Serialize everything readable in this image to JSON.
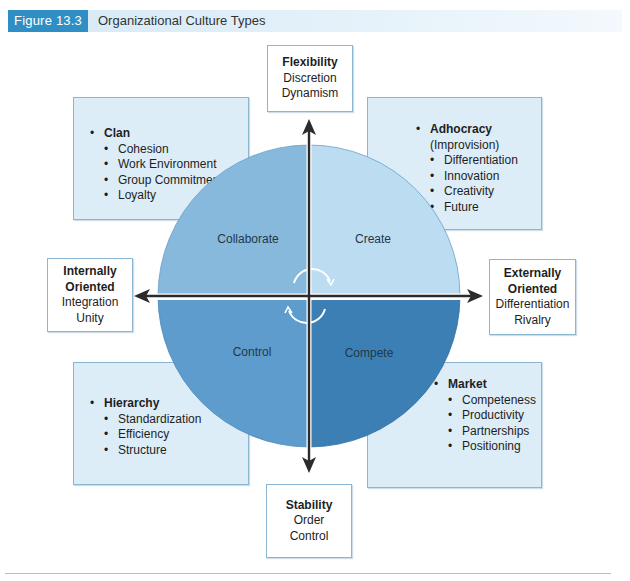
{
  "figure": {
    "label": "Figure 13.3",
    "title": "Organizational Culture Types",
    "colors": {
      "label_bg": "#2f8fc4",
      "header_bg": "#d4e9f6",
      "box_fill": "#dcedf8",
      "box_border": "#8ab6d3",
      "collaborate": "#87b9dd",
      "create": "#bcdcf1",
      "control": "#5d9ccd",
      "compete": "#3c7fb5",
      "arrow": "#2b2b2b"
    }
  },
  "axes": {
    "top": {
      "title": "Flexibility",
      "lines": [
        "Discretion",
        "Dynamism"
      ]
    },
    "bottom": {
      "title": "Stability",
      "lines": [
        "Order",
        "Control"
      ]
    },
    "left": {
      "title_line1": "Internally",
      "title_line2": "Oriented",
      "lines": [
        "Integration",
        "Unity"
      ]
    },
    "right": {
      "title_line1": "Externally",
      "title_line2": "Oriented",
      "lines": [
        "Differentiation",
        "Rivalry"
      ]
    }
  },
  "quadrants": {
    "top_left": "Collaborate",
    "top_right": "Create",
    "bottom_left": "Control",
    "bottom_right": "Compete"
  },
  "cultures": {
    "clan": {
      "name": "Clan",
      "items": [
        "Cohesion",
        "Work Environment",
        "Group Commitment",
        "Loyalty"
      ]
    },
    "adhocracy": {
      "name": "Adhocracy",
      "subtitle": "(Improvision)",
      "items": [
        "Differentiation",
        "Innovation",
        "Creativity",
        "Future"
      ]
    },
    "hierarchy": {
      "name": "Hierarchy",
      "items": [
        "Standardization",
        "Efficiency",
        "Structure"
      ]
    },
    "market": {
      "name": "Market",
      "items": [
        "Competeness",
        "Productivity",
        "Partnerships",
        "Positioning"
      ]
    }
  }
}
